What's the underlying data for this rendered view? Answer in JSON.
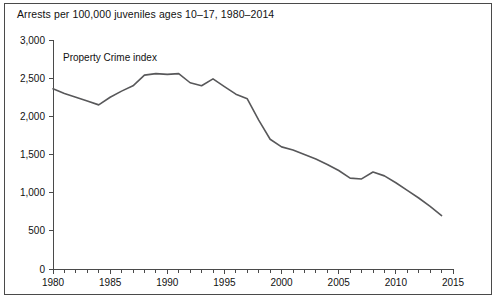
{
  "figure": {
    "title": "Arrests per 100,000 juveniles ages 10–17, 1980–2014",
    "border_color": "#4a4a4a",
    "background": "#ffffff"
  },
  "chart_data": {
    "type": "line",
    "title": "Arrests per 100,000 juveniles ages 10–17, 1980–2014",
    "subtitle": "",
    "xlabel": "",
    "ylabel": "",
    "xlim": [
      1980,
      2015
    ],
    "ylim": [
      0,
      3000
    ],
    "grid": false,
    "legend_position": "inline-annotation",
    "line_color": "#58585a",
    "annotations": [
      {
        "text": "Property Crime index",
        "x": 1981,
        "y": 2800
      }
    ],
    "y_ticks": [
      0,
      500,
      1000,
      1500,
      2000,
      2500,
      3000
    ],
    "y_tick_labels": [
      "0",
      "500",
      "1,000",
      "1,500",
      "2,000",
      "2,500",
      "3,000"
    ],
    "x_ticks": [
      1980,
      1985,
      1990,
      1995,
      2000,
      2005,
      2010,
      2015
    ],
    "x_tick_labels": [
      "1980",
      "1985",
      "1990",
      "1995",
      "2000",
      "2005",
      "2010",
      "2015"
    ],
    "x_minor_tick_step": 1,
    "series": [
      {
        "name": "Property Crime index",
        "x": [
          1980,
          1981,
          1982,
          1983,
          1984,
          1985,
          1986,
          1987,
          1988,
          1989,
          1990,
          1991,
          1992,
          1993,
          1994,
          1995,
          1996,
          1997,
          1998,
          1999,
          2000,
          2001,
          2002,
          2003,
          2004,
          2005,
          2006,
          2007,
          2008,
          2009,
          2010,
          2011,
          2012,
          2013,
          2014
        ],
        "values": [
          2360,
          2300,
          2250,
          2200,
          2150,
          2250,
          2330,
          2400,
          2540,
          2560,
          2550,
          2560,
          2440,
          2400,
          2490,
          2390,
          2290,
          2230,
          1950,
          1700,
          1600,
          1560,
          1500,
          1440,
          1370,
          1290,
          1190,
          1180,
          1270,
          1220,
          1130,
          1030,
          930,
          820,
          700
        ]
      }
    ]
  }
}
